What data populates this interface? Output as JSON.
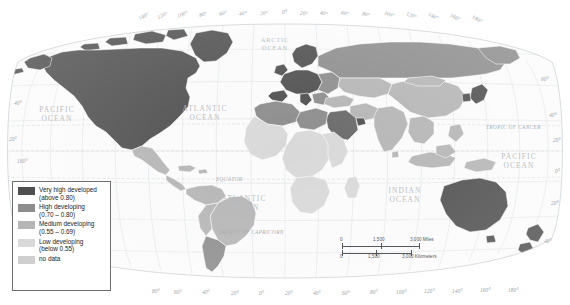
{
  "map": {
    "title": "World map of human development levels",
    "projection": "Robinson",
    "oceans": [
      {
        "name": "ARCTIC OCEAN",
        "line1": "ARCTIC",
        "line2": "OCEAN",
        "x": 252,
        "y": 36,
        "size": "sm"
      },
      {
        "name": "PACIFIC OCEAN (east)",
        "line1": "PACIFIC",
        "line2": "OCEAN",
        "x": 29,
        "y": 105,
        "size": "lg"
      },
      {
        "name": "ATLANTIC OCEAN (north)",
        "line1": "ATLANTIC",
        "line2": "OCEAN",
        "x": 176,
        "y": 104,
        "size": "lg"
      },
      {
        "name": "ATLANTIC OCEAN (south)",
        "line1": "ATLANTIC",
        "line2": "OCEAN",
        "x": 215,
        "y": 194,
        "size": "lg"
      },
      {
        "name": "INDIAN OCEAN",
        "line1": "INDIAN",
        "line2": "OCEAN",
        "x": 378,
        "y": 186,
        "size": "lg"
      },
      {
        "name": "PACIFIC OCEAN (west)",
        "line1": "PACIFIC",
        "line2": "OCEAN",
        "x": 492,
        "y": 152,
        "size": "lg"
      }
    ],
    "reference_lines": [
      {
        "name": "TROPIC OF CANCER",
        "label": "TROPIC OF CANCER",
        "x": 486,
        "y": 124
      },
      {
        "name": "EQUATOR",
        "label": "EQUATOR",
        "x": 216,
        "y": 176
      },
      {
        "name": "TROPIC OF CAPRICORN",
        "label": "TROPIC OF CAPRICORN",
        "x": 219,
        "y": 229
      }
    ],
    "longitude_top": [
      "140°",
      "120°",
      "100°",
      "80°",
      "60°",
      "40°",
      "20°",
      "0°",
      "20°",
      "40°",
      "60°",
      "80°",
      "100°",
      "120°",
      "140°",
      "160°",
      "180°"
    ],
    "longitude_bottom": [
      "80°",
      "60°",
      "40°",
      "20°",
      "0°",
      "20°",
      "40°",
      "60°",
      "80°",
      "100°",
      "120°",
      "140°",
      "160°",
      "180°"
    ],
    "latitude_left": [
      "40°",
      "20°",
      "160°"
    ],
    "latitude_right": [
      "60°",
      "40°",
      "20°",
      "0°",
      "20°",
      "40°"
    ]
  },
  "legend": {
    "name": "map-legend",
    "items": [
      {
        "label": "Very high developed",
        "range": "(above 0.80)",
        "color": "#4f4f4f",
        "key": "very-high-developed"
      },
      {
        "label": "High developing",
        "range": "(0.70 – 0.80)",
        "color": "#8d8d8d",
        "key": "high-developing"
      },
      {
        "label": "Medium developing",
        "range": "(0.55 – 0.69)",
        "color": "#b5b5b5",
        "key": "medium-developing"
      },
      {
        "label": "Low developing",
        "range": "(below 0.55)",
        "color": "#d9d9d9",
        "key": "low-developing"
      },
      {
        "label": "no data",
        "range": "",
        "color": "#cfcfcf",
        "key": "no-data"
      }
    ]
  },
  "scalebar": {
    "name": "map-scale-bar",
    "miles": {
      "zero": "0",
      "mid": "1,500",
      "end": "3,000 Miles"
    },
    "kilometers": {
      "zero": "0",
      "mid": "1,500",
      "end": "3,000 Kilometers"
    }
  },
  "colors": {
    "very_high": "#4f4f4f",
    "high": "#8d8d8d",
    "medium": "#b5b5b5",
    "low": "#d9d9d9",
    "no_data": "#cfcfcf",
    "ocean": "#fbfbfb",
    "graticule": "#d7dadd",
    "border": "#ffffff",
    "label": "#b9bfc5"
  }
}
